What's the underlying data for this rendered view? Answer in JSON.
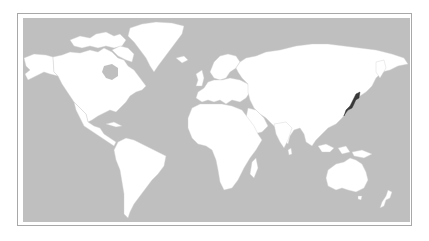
{
  "map": {
    "title": "World map",
    "projection": "Mercator (Pacific-cut, Atlantic-centered)",
    "highlighted_country": "Japan",
    "colors": {
      "ocean": "#bfbfbf",
      "land": "#ffffff",
      "borders": "#c8c8c8",
      "highlight": "#3a3a3a",
      "frame": "#a8a8a8"
    },
    "regions": [
      {
        "name": "North America",
        "highlighted": false
      },
      {
        "name": "Greenland",
        "highlighted": false
      },
      {
        "name": "South America",
        "highlighted": false
      },
      {
        "name": "Europe",
        "highlighted": false
      },
      {
        "name": "Africa",
        "highlighted": false
      },
      {
        "name": "Asia",
        "highlighted": false
      },
      {
        "name": "Japan",
        "highlighted": true
      },
      {
        "name": "Australia",
        "highlighted": false
      },
      {
        "name": "New Zealand",
        "highlighted": false
      }
    ]
  }
}
